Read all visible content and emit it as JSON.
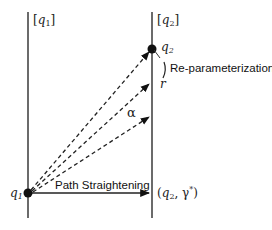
{
  "diagram": {
    "left_axis": {
      "label": "[q1]",
      "label_base": "q",
      "label_sub": "1"
    },
    "right_axis": {
      "label": "[q2]",
      "label_base": "q",
      "label_sub": "2"
    },
    "points": {
      "q1": {
        "label": "q1",
        "base": "q",
        "sub": "1"
      },
      "q2": {
        "label": "q2",
        "base": "q",
        "sub": "2"
      },
      "r": {
        "label": "r"
      },
      "target": {
        "label": "(q2, γ*)",
        "open": "(",
        "base": "q",
        "sub": "2",
        "sep": ", ",
        "gamma": "γ",
        "star": "*",
        "close": ")"
      }
    },
    "annotations": {
      "reparam": "Re-parameterization",
      "alpha": "α",
      "path_straightening": "Path Straightening"
    },
    "colors": {
      "line": "#3a3a3a",
      "dot": "#111111",
      "text": "#222222"
    }
  }
}
